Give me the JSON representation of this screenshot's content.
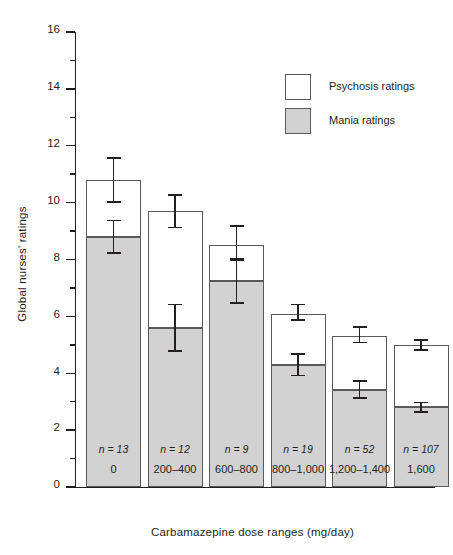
{
  "chart_data": {
    "type": "bar",
    "stacked": true,
    "title": "",
    "xlabel": "Carbamazepine dose ranges (mg/day)",
    "ylabel": "Global nurses' ratings",
    "categories": [
      "0",
      "200–400",
      "600–800",
      "800–1,000",
      "1,200–1,400",
      "1,600"
    ],
    "ylim": [
      0,
      16
    ],
    "yticks": [
      0,
      2,
      4,
      6,
      8,
      10,
      12,
      14,
      16
    ],
    "ytick_labels": [
      "0",
      "2",
      "4",
      "6",
      "8",
      "10",
      "12",
      "14",
      "16"
    ],
    "grid": false,
    "legend_position": "top-right",
    "series": [
      {
        "name": "Mania ratings",
        "color": "#d2d2d2",
        "values": [
          8.8,
          5.6,
          7.25,
          4.3,
          3.4,
          2.8
        ],
        "errors_low": [
          8.2,
          4.75,
          6.45,
          3.9,
          3.1,
          2.6
        ],
        "errors_high": [
          9.4,
          6.45,
          8.0,
          4.7,
          3.75,
          3.0
        ]
      },
      {
        "name": "Psychosis ratings",
        "color": "#ffffff",
        "values": [
          10.8,
          9.7,
          8.5,
          6.1,
          5.3,
          5.0
        ],
        "errors_low": [
          10.0,
          9.1,
          8.0,
          5.85,
          5.05,
          4.8
        ],
        "errors_high": [
          11.6,
          10.3,
          9.2,
          6.45,
          5.65,
          5.2
        ],
        "note": "values are cumulative bar tops (total ratings)"
      }
    ],
    "annotations": [
      {
        "label": "n = 13",
        "category": "0"
      },
      {
        "label": "n = 12",
        "category": "200–400"
      },
      {
        "label": "n = 9",
        "category": "600–800"
      },
      {
        "label": "n = 19",
        "category": "800–1,000"
      },
      {
        "label": "n = 52",
        "category": "1,200–1,400"
      },
      {
        "label": "n = 107",
        "category": "1,600"
      }
    ]
  },
  "legend": {
    "items": [
      {
        "label": "Psychosis ratings",
        "swatch": "white"
      },
      {
        "label": "Mania ratings",
        "swatch": "gray"
      }
    ]
  },
  "axis": {
    "y_title": "Global nurses' ratings",
    "x_title": "Carbamazepine dose ranges (mg/day)"
  }
}
